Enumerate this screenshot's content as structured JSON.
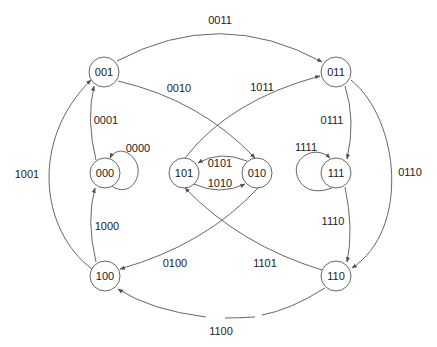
{
  "diagram": {
    "type": "state-diagram",
    "nodes": [
      {
        "id": "001",
        "label": "001"
      },
      {
        "id": "011",
        "label": "011"
      },
      {
        "id": "000",
        "label": "000"
      },
      {
        "id": "101",
        "label": "101"
      },
      {
        "id": "010",
        "label": "010"
      },
      {
        "id": "111",
        "label": "111"
      },
      {
        "id": "100",
        "label": "100"
      },
      {
        "id": "110",
        "label": "110"
      }
    ],
    "edges": [
      {
        "from": "001",
        "to": "011",
        "label": "0011"
      },
      {
        "from": "001",
        "to": "010",
        "label": "0010"
      },
      {
        "from": "000",
        "to": "001",
        "label": "0001"
      },
      {
        "from": "000",
        "to": "000",
        "label": "0000"
      },
      {
        "from": "100",
        "to": "001",
        "label": "1001"
      },
      {
        "from": "101",
        "to": "011",
        "label": "1011"
      },
      {
        "from": "010",
        "to": "101",
        "label": "0101"
      },
      {
        "from": "101",
        "to": "010",
        "label": "1010"
      },
      {
        "from": "011",
        "to": "111",
        "label": "0111"
      },
      {
        "from": "111",
        "to": "111",
        "label": "1111"
      },
      {
        "from": "011",
        "to": "110",
        "label": "0110"
      },
      {
        "from": "100",
        "to": "000",
        "label": "1000"
      },
      {
        "from": "010",
        "to": "100",
        "label": "0100"
      },
      {
        "from": "110",
        "to": "101",
        "label": "1101"
      },
      {
        "from": "111",
        "to": "110",
        "label": "1110"
      },
      {
        "from": "110",
        "to": "100",
        "label": "1100"
      }
    ]
  }
}
